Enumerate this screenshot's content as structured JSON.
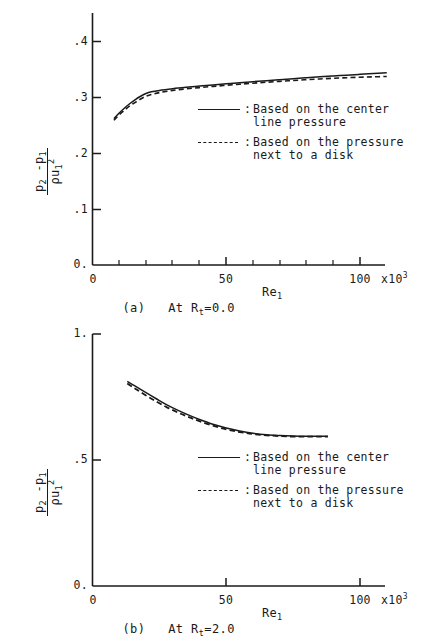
{
  "chart_data": [
    {
      "id": "a",
      "type": "line",
      "title": "(a) At Rt=0.0",
      "caption_prefix": "(a)   At R",
      "caption_sub": "t",
      "caption_suffix": "=0.0",
      "xlabel": "Re",
      "xlabel_sub": "1",
      "ylabel_numerator": "p2 -p1",
      "ylabel_denominator": "ρ u1^2",
      "xlim": [
        0,
        110
      ],
      "ylim": [
        0.0,
        0.4
      ],
      "xtick_labels": [
        "0",
        "50",
        "100"
      ],
      "xtick_values": [
        0,
        50,
        100
      ],
      "xminor_step": 10,
      "ytick_labels": [
        "0.",
        ".1",
        ".2",
        ".3",
        ".4"
      ],
      "ytick_values": [
        0.0,
        0.1,
        0.2,
        0.3,
        0.4
      ],
      "x_exponent_label": "x10",
      "x_exponent_sup": "3",
      "grid": false,
      "legend_position": "center-right",
      "series": [
        {
          "name": "Based on the center line pressure",
          "style": "solid",
          "x": [
            8,
            10,
            12,
            14,
            16,
            18,
            20,
            22,
            25,
            30,
            35,
            40,
            45,
            50,
            55,
            60,
            65,
            70,
            75,
            80,
            85,
            90,
            95,
            100,
            105,
            110
          ],
          "values": [
            0.262,
            0.272,
            0.281,
            0.289,
            0.296,
            0.302,
            0.307,
            0.31,
            0.3125,
            0.3155,
            0.318,
            0.3202,
            0.3222,
            0.3242,
            0.3262,
            0.3281,
            0.3299,
            0.3317,
            0.3334,
            0.3351,
            0.3367,
            0.3383,
            0.3398,
            0.3413,
            0.3427,
            0.344
          ]
        },
        {
          "name": "Based on the pressure next to a disk",
          "style": "dashed",
          "x": [
            8,
            10,
            12,
            14,
            16,
            18,
            20,
            22,
            25,
            30,
            35,
            40,
            45,
            50,
            55,
            60,
            65,
            70,
            75,
            80,
            85,
            90,
            95,
            100,
            105,
            110
          ],
          "values": [
            0.259,
            0.269,
            0.277,
            0.285,
            0.291,
            0.297,
            0.302,
            0.305,
            0.3085,
            0.3125,
            0.3152,
            0.3175,
            0.3196,
            0.3217,
            0.3236,
            0.3254,
            0.3271,
            0.3287,
            0.3302,
            0.3317,
            0.333,
            0.3342,
            0.3352,
            0.3361,
            0.3368,
            0.3374
          ]
        }
      ],
      "legend": [
        {
          "key": "solid",
          "colon": ":",
          "line1": "Based on the center",
          "line2": "line pressure"
        },
        {
          "key": "dashed",
          "colon": ":",
          "line1": "Based on the pressure",
          "line2": "next to a disk"
        }
      ]
    },
    {
      "id": "b",
      "type": "line",
      "title": "(b) At Rt=2.0",
      "caption_prefix": "(b)   At R",
      "caption_sub": "t",
      "caption_suffix": "=2.0",
      "xlabel": "Re",
      "xlabel_sub": "1",
      "ylabel_numerator": "p2 -p1",
      "ylabel_denominator": "ρ u1^2",
      "xlim": [
        0,
        110
      ],
      "ylim": [
        0.0,
        1.0
      ],
      "xtick_labels": [
        "0",
        "50",
        "100"
      ],
      "xtick_values": [
        0,
        50,
        100
      ],
      "xminor_step": 10,
      "ytick_labels": [
        "0.",
        ".5",
        "1."
      ],
      "ytick_values": [
        0.0,
        0.5,
        1.0
      ],
      "x_exponent_label": "x10",
      "x_exponent_sup": "3",
      "grid": false,
      "legend_position": "center-right",
      "series": [
        {
          "name": "Based on the center line pressure",
          "style": "solid",
          "x": [
            13,
            16,
            20,
            24,
            28,
            32,
            36,
            40,
            45,
            50,
            55,
            60,
            65,
            70,
            75,
            80,
            85,
            88
          ],
          "values": [
            0.812,
            0.793,
            0.767,
            0.742,
            0.718,
            0.697,
            0.678,
            0.661,
            0.642,
            0.627,
            0.615,
            0.606,
            0.6,
            0.597,
            0.595,
            0.594,
            0.594,
            0.594
          ]
        },
        {
          "name": "Based on the pressure next to a disk",
          "style": "dashed",
          "x": [
            13,
            16,
            20,
            24,
            28,
            32,
            36,
            40,
            45,
            50,
            55,
            60,
            65,
            70,
            75,
            80,
            85,
            88
          ],
          "values": [
            0.804,
            0.783,
            0.756,
            0.731,
            0.708,
            0.688,
            0.67,
            0.654,
            0.636,
            0.622,
            0.611,
            0.603,
            0.598,
            0.595,
            0.593,
            0.593,
            0.593,
            0.593
          ]
        }
      ],
      "legend": [
        {
          "key": "solid",
          "colon": ":",
          "line1": "Based on the center",
          "line2": "line pressure"
        },
        {
          "key": "dashed",
          "colon": ":",
          "line1": "Based on the pressure",
          "line2": "next to a disk"
        }
      ]
    }
  ],
  "labels": {
    "p2": "p",
    "sub2": "2",
    "minus_p1": "-p",
    "sub1": "1",
    "rho": "ρ",
    "u": "u",
    "num_text": "p",
    "den_text": "u"
  }
}
